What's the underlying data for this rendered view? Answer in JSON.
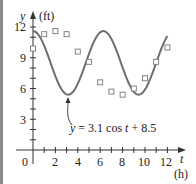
{
  "chart_data": {
    "type": "scatter+line",
    "title": "",
    "xlabel": "t",
    "xunit": "(h)",
    "ylabel": "y",
    "yunit": "(ft)",
    "xlim": [
      0,
      12.8
    ],
    "ylim": [
      0,
      12.5
    ],
    "x_ticks": [
      2,
      4,
      6,
      8,
      10,
      12
    ],
    "x_minor_ticks": [
      1,
      2,
      3,
      4,
      5,
      6,
      7,
      8,
      9,
      10,
      11,
      12
    ],
    "y_ticks": [
      3,
      6,
      9,
      12
    ],
    "origin_label": "0",
    "grid": false,
    "series": [
      {
        "name": "data",
        "kind": "scatter",
        "marker": "open-square",
        "x": [
          0,
          1,
          2,
          3,
          4,
          5,
          6,
          7,
          8,
          9,
          10,
          11,
          12
        ],
        "y": [
          9.9,
          11.3,
          11.6,
          11.3,
          9.6,
          8.6,
          6.6,
          5.7,
          5.4,
          6.0,
          7.0,
          8.6,
          10.0
        ]
      },
      {
        "name": "model",
        "kind": "line",
        "equation": "y = 3.1 cos t + 8.5",
        "amplitude": 3.1,
        "offset": 8.5,
        "t_range": [
          0,
          12
        ]
      }
    ],
    "annotation": {
      "text": "y = 3.1 cos t + 8.5",
      "arrow_to": [
        3.14,
        5.4
      ]
    }
  },
  "labels": {
    "y_axis": "y",
    "y_unit": "(ft)",
    "x_axis": "t",
    "x_unit": "(h)",
    "origin": "0",
    "y12": "12",
    "y9": "9",
    "y6": "6",
    "y3": "3",
    "x2": "2",
    "x4": "4",
    "x6": "6",
    "x8": "8",
    "x10": "10",
    "x12": "12",
    "eq_y": "y",
    "eq_rest": " = 3.1 cos ",
    "eq_t": "t",
    "eq_tail": " + 8.5"
  },
  "colors": {
    "curve": "#6e6e6e",
    "axis": "#333333",
    "marker": "#777777",
    "left_bar": "#8a8a8a"
  }
}
